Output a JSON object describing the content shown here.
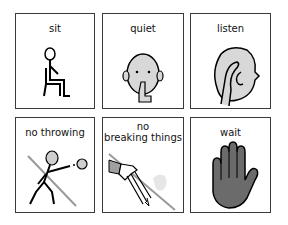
{
  "cards": [
    {
      "label": "sit",
      "icon": "sitting-person-icon"
    },
    {
      "label": "quiet",
      "icon": "quiet-face-icon"
    },
    {
      "label": "listen",
      "icon": "listening-ear-icon"
    },
    {
      "label": "no throwing",
      "icon": "no-throwing-icon"
    },
    {
      "label_line1": "no",
      "label_line2": "breaking things",
      "icon": "no-breaking-icon"
    },
    {
      "label": "wait",
      "icon": "hand-wait-icon"
    }
  ],
  "colors": {
    "border": "#3a3a3a",
    "fill_grey": "#cfcfcf",
    "hand_fill": "#6b6b6b",
    "slash": "#9a9a9a"
  }
}
